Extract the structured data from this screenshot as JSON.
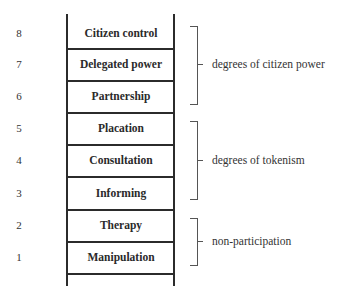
{
  "ladder": {
    "rungs": [
      {
        "number": "8",
        "label": "Citizen control"
      },
      {
        "number": "7",
        "label": "Delegated power"
      },
      {
        "number": "6",
        "label": "Partnership"
      },
      {
        "number": "5",
        "label": "Placation"
      },
      {
        "number": "4",
        "label": "Consultation"
      },
      {
        "number": "3",
        "label": "Informing"
      },
      {
        "number": "2",
        "label": "Therapy"
      },
      {
        "number": "1",
        "label": "Manipulation"
      }
    ]
  },
  "groups": [
    {
      "label": "degrees of citizen power",
      "rungs": [
        "8",
        "7",
        "6"
      ]
    },
    {
      "label": "degrees of tokenism",
      "rungs": [
        "5",
        "4",
        "3"
      ]
    },
    {
      "label": "non-participation",
      "rungs": [
        "2",
        "1"
      ]
    }
  ]
}
